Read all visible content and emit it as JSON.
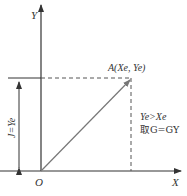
{
  "diagram": {
    "axis_x_label": "X",
    "axis_y_label": "Y",
    "origin_label": "O",
    "point_label": "A(Xe, Ye)",
    "dimension_label": "J=Ye",
    "condition_line1": "Ye>Xe",
    "condition_line2": "取G=GY",
    "colors": {
      "axis": "#333333",
      "vector": "#777777",
      "dashed": "#555555"
    }
  }
}
